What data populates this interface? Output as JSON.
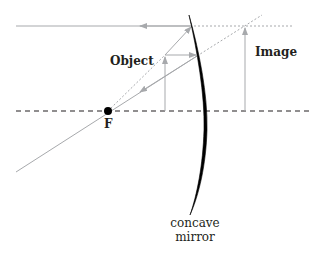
{
  "diagram": {
    "labels": {
      "object": "Object",
      "image": "Image",
      "focal_point": "F",
      "mirror_line1": "concave",
      "mirror_line2": "mirror"
    },
    "colors": {
      "ray": "#a7a9ac",
      "mirror": "#000000",
      "axis": "#231f20",
      "text": "#231f20"
    }
  }
}
